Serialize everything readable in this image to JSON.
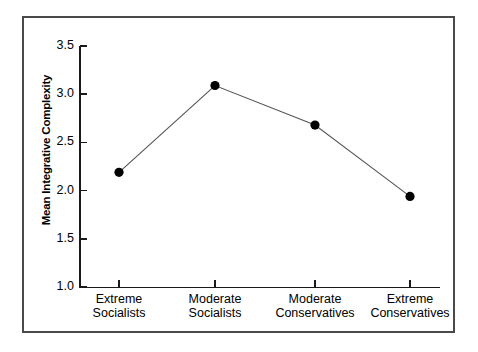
{
  "chart_data": {
    "type": "line",
    "title": "",
    "xlabel": "",
    "ylabel": "Mean Integrative Complexity",
    "ylim": [
      1.0,
      3.5
    ],
    "yticks": [
      "1.0",
      "1.5",
      "2.0",
      "2.5",
      "3.0",
      "3.5"
    ],
    "ytick_values": [
      1.0,
      1.5,
      2.0,
      2.5,
      3.0,
      3.5
    ],
    "grid": false,
    "legend": "none",
    "marker": "filled-circle",
    "line_color": "#555555",
    "marker_color": "#000000",
    "categories": [
      {
        "line1": "Extreme",
        "line2": "Socialists"
      },
      {
        "line1": "Moderate",
        "line2": "Socialists"
      },
      {
        "line1": "Moderate",
        "line2": "Conservatives"
      },
      {
        "line1": "Extreme",
        "line2": "Conservatives"
      }
    ],
    "category_labels": [
      "Extreme Socialists",
      "Moderate Socialists",
      "Moderate Conservatives",
      "Extreme Conservatives"
    ],
    "values": [
      2.19,
      3.09,
      2.68,
      1.94
    ]
  }
}
